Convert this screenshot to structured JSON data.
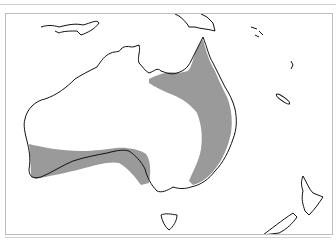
{
  "map": {
    "region": "Australia and surrounding islands",
    "layers": [
      {
        "name": "coastline",
        "color": "#000000"
      },
      {
        "name": "distribution-range",
        "color": "#9a9a9a"
      }
    ],
    "colors": {
      "background": "#ffffff",
      "land_outline": "#111111",
      "range_fill": "#9a9a9a",
      "frame_border": "#bdbdbd"
    }
  }
}
